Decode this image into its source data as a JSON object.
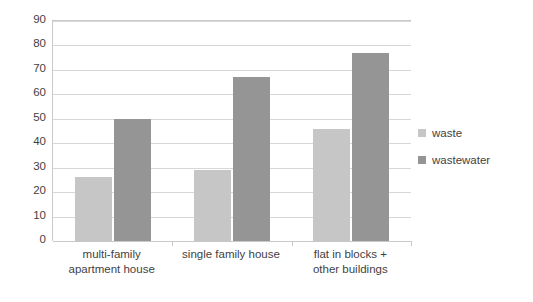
{
  "chart_data": {
    "type": "bar",
    "title": "",
    "xlabel": "",
    "ylabel": "",
    "ylim": [
      0,
      90
    ],
    "yticks": [
      0,
      10,
      20,
      30,
      40,
      50,
      60,
      70,
      80,
      90
    ],
    "grid": true,
    "legend_position": "right",
    "categories": [
      "multi-family\napartment house",
      "single family house",
      "flat in blocks +\nother buildings"
    ],
    "category_lines": [
      [
        "multi-family",
        "apartment house"
      ],
      [
        "single family house"
      ],
      [
        "flat in blocks +",
        "other buildings"
      ]
    ],
    "series": [
      {
        "name": "waste",
        "color": "#c6c6c6",
        "values": [
          26,
          29,
          46
        ]
      },
      {
        "name": "wastewater",
        "color": "#959595",
        "values": [
          50,
          67,
          77
        ]
      }
    ]
  },
  "legend": {
    "items": [
      {
        "label": "waste",
        "color": "#c6c6c6"
      },
      {
        "label": "wastewater",
        "color": "#959595"
      }
    ]
  },
  "colors": {
    "background": "#ffffff",
    "gridline": "#d7d7d7",
    "axis": "#c9c9c9",
    "text": "#3f3f3f",
    "waste": "#c6c6c6",
    "wastewater": "#959595"
  }
}
